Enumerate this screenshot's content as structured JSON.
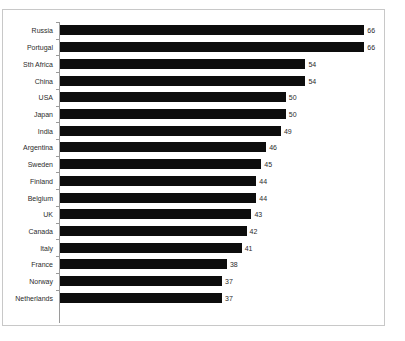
{
  "chart_data": {
    "type": "bar",
    "orientation": "horizontal",
    "title": "",
    "subtitle": "",
    "xlabel": "",
    "ylabel": "",
    "grid": false,
    "legend": null,
    "legend_position": "none",
    "xlim": [
      4,
      70
    ],
    "categories": [
      "Russia",
      "Portugal",
      "Sth Africa",
      "China",
      "USA",
      "Japan",
      "India",
      "Argentina",
      "Sweden",
      "Finland",
      "Belgium",
      "UK",
      "Canada",
      "Italy",
      "France",
      "Norway",
      "Netherlands"
    ],
    "values": [
      66,
      66,
      54,
      54,
      50,
      50,
      49,
      46,
      45,
      44,
      44,
      43,
      42,
      41,
      38,
      37,
      37
    ],
    "value_labels": [
      "66",
      "66",
      "54",
      "54",
      "50",
      "50",
      "49",
      "46",
      "45",
      "44",
      "44",
      "43",
      "42",
      "41",
      "38",
      "37",
      "37"
    ],
    "series": [
      {
        "name": "Series 1",
        "values": [
          66,
          66,
          54,
          54,
          50,
          50,
          49,
          46,
          45,
          44,
          44,
          43,
          42,
          41,
          38,
          37,
          37
        ]
      }
    ],
    "bar_color": "#0d0d0d",
    "frame_color": "#c8c8c8",
    "axis_color": "#9a9a9a",
    "background": "#ffffff"
  }
}
